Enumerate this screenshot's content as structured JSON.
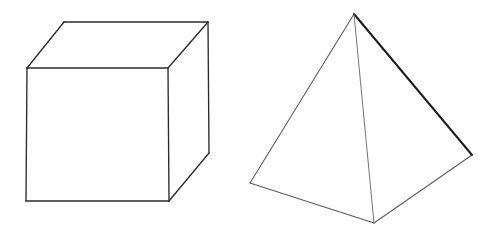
{
  "figure": {
    "background_color": "#ffffff",
    "canvas": {
      "width": 495,
      "height": 237
    },
    "stroke_colors": {
      "strong": "#1c1c1c",
      "normal": "#2b2b2b",
      "light": "#5a5a5a",
      "faint": "#6e6e6e"
    },
    "shapes": [
      {
        "id": "cube",
        "name": "Cube",
        "kind": "hexahedron",
        "projection": "three-quarter view, top and right faces visible",
        "vertices": {
          "front_top_left": [
            27,
            68
          ],
          "front_top_right": [
            168,
            68
          ],
          "front_bottom_right": [
            169,
            201
          ],
          "front_bottom_left": [
            26,
            201
          ],
          "back_top_left": [
            64,
            22
          ],
          "back_top_right": [
            208,
            22
          ],
          "back_bottom_right": [
            209,
            153
          ]
        },
        "faces": {
          "front": "27,68 168,68 169,201 26,201",
          "top": "27,68 64,22 208,22 168,68",
          "right": "168,68 208,22 209,153 169,201"
        },
        "edges": [
          {
            "id": "cube-edge-front-top",
            "from": [
              27,
              68
            ],
            "to": [
              168,
              68
            ],
            "weight": "normal"
          },
          {
            "id": "cube-edge-front-right",
            "from": [
              168,
              68
            ],
            "to": [
              169,
              201
            ],
            "weight": "normal"
          },
          {
            "id": "cube-edge-front-bottom",
            "from": [
              169,
              201
            ],
            "to": [
              26,
              201
            ],
            "weight": "normal"
          },
          {
            "id": "cube-edge-front-left",
            "from": [
              26,
              201
            ],
            "to": [
              27,
              68
            ],
            "weight": "normal"
          },
          {
            "id": "cube-edge-top-left",
            "from": [
              27,
              68
            ],
            "to": [
              64,
              22
            ],
            "weight": "normal"
          },
          {
            "id": "cube-edge-top-back",
            "from": [
              64,
              22
            ],
            "to": [
              208,
              22
            ],
            "weight": "normal"
          },
          {
            "id": "cube-edge-top-right",
            "from": [
              208,
              22
            ],
            "to": [
              168,
              68
            ],
            "weight": "normal"
          },
          {
            "id": "cube-edge-back-right",
            "from": [
              208,
              22
            ],
            "to": [
              209,
              153
            ],
            "weight": "normal"
          },
          {
            "id": "cube-edge-right-bottom",
            "from": [
              209,
              153
            ],
            "to": [
              169,
              201
            ],
            "weight": "normal"
          }
        ]
      },
      {
        "id": "pyramid",
        "name": "Square Pyramid",
        "kind": "square-pyramid",
        "projection": "three-quarter view, apex up, back base vertex hidden",
        "vertices": {
          "apex": [
            354,
            14
          ],
          "base_left": [
            250,
            183
          ],
          "base_front": [
            374,
            223
          ],
          "base_right": [
            472,
            155
          ]
        },
        "faces": {
          "left": "354,14 250,183 374,223",
          "right": "354,14 374,223 472,155"
        },
        "edges": [
          {
            "id": "pyramid-edge-apex-left",
            "from": [
              354,
              14
            ],
            "to": [
              250,
              183
            ],
            "weight": "light"
          },
          {
            "id": "pyramid-edge-apex-right",
            "from": [
              354,
              14
            ],
            "to": [
              472,
              155
            ],
            "weight": "strong"
          },
          {
            "id": "pyramid-edge-apex-front",
            "from": [
              354,
              14
            ],
            "to": [
              374,
              223
            ],
            "weight": "faint"
          },
          {
            "id": "pyramid-edge-base-left-front",
            "from": [
              250,
              183
            ],
            "to": [
              374,
              223
            ],
            "weight": "light"
          },
          {
            "id": "pyramid-edge-base-front-right",
            "from": [
              374,
              223
            ],
            "to": [
              472,
              155
            ],
            "weight": "light"
          }
        ]
      }
    ]
  }
}
